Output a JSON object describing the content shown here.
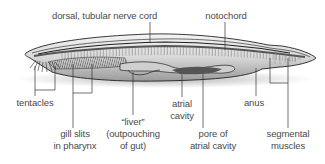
{
  "diagram": {
    "labels": {
      "nerve_cord": "dorsal, tubular nerve cord",
      "notochord": "notochord",
      "tentacles": "tentacles",
      "gill_slits_1": "gill slits",
      "gill_slits_2": "in pharynx",
      "liver_1": "“liver”",
      "liver_2": "(outpouching",
      "liver_3": "of gut)",
      "atrial_cavity_1": "atrial",
      "atrial_cavity_2": "cavity",
      "pore_1": "pore of",
      "pore_2": "atrial cavity",
      "anus": "anus",
      "segmental_1": "segmental",
      "segmental_2": "muscles"
    },
    "colors": {
      "background": "#ffffff",
      "text": "#4a4a4a",
      "leader_line": "#333333",
      "body_outline": "#222222",
      "body_fill": "#e8e8e8"
    }
  }
}
